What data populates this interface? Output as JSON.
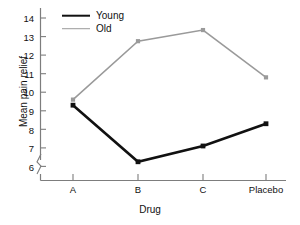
{
  "chart_data": {
    "type": "line",
    "title": "",
    "xlabel": "Drug",
    "ylabel": "Mean pain relief",
    "categories": [
      "A",
      "B",
      "C",
      "Placebo"
    ],
    "ylim": [
      6,
      14
    ],
    "yticks": [
      6,
      7,
      8,
      9,
      10,
      11,
      12,
      13,
      14
    ],
    "ytick_labels": [
      "6",
      "7",
      "8",
      "9",
      "10",
      "11",
      "12",
      "13",
      "14"
    ],
    "axis_break": true,
    "grid": false,
    "legend_position": "upper-left-inside",
    "series": [
      {
        "name": "Young",
        "values": [
          9.3,
          6.25,
          7.1,
          8.3
        ],
        "color": "#111111",
        "line_width": 2.6,
        "marker": "square"
      },
      {
        "name": "Old",
        "values": [
          9.6,
          12.75,
          13.35,
          10.8
        ],
        "color": "#9a9a9a",
        "line_width": 1.5,
        "marker": "square"
      }
    ]
  },
  "legend": {
    "items": [
      {
        "label": "Young"
      },
      {
        "label": "Old"
      }
    ]
  },
  "axes": {
    "y_title": "Mean pain relief",
    "x_title": "Drug"
  }
}
